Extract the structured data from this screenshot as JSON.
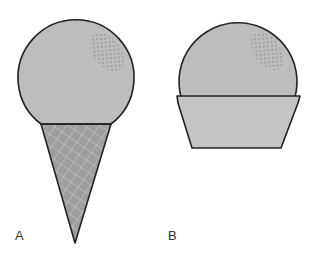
{
  "figure": {
    "panels": [
      {
        "label": "A",
        "name": "ice-cream-cone"
      },
      {
        "label": "B",
        "name": "ice-cream-cup"
      }
    ],
    "colors": {
      "scoop_fill": "#bdbdbd",
      "cone_fill": "#9e9e9e",
      "cup_fill": "#c4c4c4",
      "outline": "#222222",
      "sprinkles": "#7a7a7a"
    }
  }
}
